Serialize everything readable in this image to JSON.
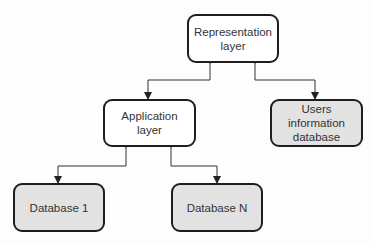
{
  "diagram": {
    "nodes": [
      {
        "id": "representation",
        "label": "Representation\nlayer",
        "fill": "#ffffff"
      },
      {
        "id": "application",
        "label": "Application\nlayer",
        "fill": "#ffffff"
      },
      {
        "id": "users_db",
        "label": "Users information\ndatabase",
        "fill": "#e2e2e2"
      },
      {
        "id": "db1",
        "label": "Database 1",
        "fill": "#e2e2e2"
      },
      {
        "id": "dbn",
        "label": "Database N",
        "fill": "#e2e2e2"
      }
    ],
    "edges": [
      {
        "from": "representation",
        "to": "application",
        "type": "bidirectional"
      },
      {
        "from": "representation",
        "to": "users_db",
        "type": "bidirectional"
      },
      {
        "from": "application",
        "to": "db1",
        "type": "bidirectional"
      },
      {
        "from": "application",
        "to": "dbn",
        "type": "bidirectional"
      }
    ]
  }
}
